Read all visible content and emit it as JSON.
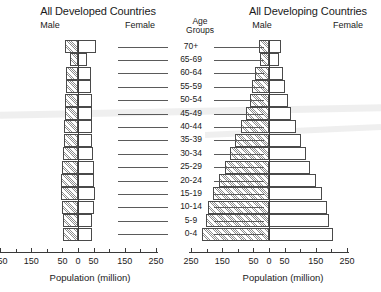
{
  "figure": {
    "axis_title_left": "Population (million)",
    "axis_title_right": "Population (million)",
    "age_header_line1": "Age",
    "age_header_line2": "Groups"
  },
  "panels": {
    "left": {
      "title": "All Developed Countries",
      "male_label": "Male",
      "female_label": "Female"
    },
    "right": {
      "title": "All Developing Countries",
      "male_label": "Male",
      "female_label": "Female"
    }
  },
  "age_groups": [
    "70+",
    "65-69",
    "60-64",
    "55-59",
    "50-54",
    "45-49",
    "40-44",
    "35-39",
    "30-34",
    "25-29",
    "20-24",
    "15-19",
    "10-14",
    "5-9",
    "0-4"
  ],
  "x_axis": {
    "tick_labels": [
      "250",
      "150",
      "50",
      "0",
      "50",
      "150",
      "250"
    ],
    "tick_values": [
      -250,
      -150,
      -50,
      0,
      50,
      150,
      250
    ],
    "minor_step": 50,
    "min": -250,
    "max": 250,
    "units": "million"
  },
  "chart_data": {
    "type": "bar",
    "subtype": "population-pyramid",
    "xlabel": "Population (million)",
    "ylabel": "Age Groups",
    "xlim": [
      -250,
      250
    ],
    "grid": false,
    "legend": [
      "Male",
      "Female"
    ],
    "legend_position": "above-panels",
    "categories": [
      "70+",
      "65-69",
      "60-64",
      "55-59",
      "50-54",
      "45-49",
      "40-44",
      "35-39",
      "30-34",
      "25-29",
      "20-24",
      "15-19",
      "10-14",
      "5-9",
      "0-4"
    ],
    "panels": [
      {
        "name": "All Developed Countries",
        "series": [
          {
            "name": "Male",
            "side": "left",
            "values": [
              42,
              26,
              37,
              40,
              41,
              42,
              44,
              45,
              48,
              50,
              53,
              56,
              52,
              48,
              47
            ]
          },
          {
            "name": "Female",
            "side": "right",
            "values": [
              58,
              30,
              41,
              43,
              44,
              44,
              45,
              46,
              48,
              50,
              52,
              54,
              50,
              46,
              45
            ]
          }
        ]
      },
      {
        "name": "All Developing Countries",
        "series": [
          {
            "name": "Male",
            "side": "left",
            "values": [
              32,
              30,
              44,
              53,
              62,
              75,
              90,
              108,
              125,
              140,
              160,
              178,
              196,
              203,
              215
            ]
          },
          {
            "name": "Female",
            "side": "right",
            "values": [
              38,
              32,
              44,
              52,
              60,
              72,
              86,
              103,
              119,
              133,
              152,
              169,
              186,
              193,
              205
            ]
          }
        ]
      }
    ]
  }
}
